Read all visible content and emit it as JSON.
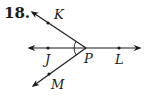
{
  "problem": {
    "number": "18."
  },
  "diagram": {
    "vertex": "P",
    "points": {
      "K": "K",
      "J": "J",
      "P": "P",
      "L": "L",
      "M": "M"
    },
    "rays": [
      "PK",
      "PJ",
      "PL",
      "PM"
    ],
    "angle_marks": [
      "KPJ",
      "JPM"
    ],
    "colors": {
      "stroke": "#1a1a1a",
      "background": "#ffffff"
    }
  }
}
